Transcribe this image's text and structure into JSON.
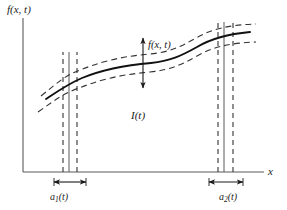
{
  "figure": {
    "type": "diagram",
    "axes": {
      "y_label": "f(x, t)",
      "x_label": "x",
      "origin_px": {
        "x": 23,
        "y": 172
      },
      "x_axis_end_px": 264,
      "y_axis_top_px": 18
    },
    "labels": {
      "y_axis": "f(x, t)",
      "x_axis": "x",
      "curve": "f(x, t)",
      "region": "I(t)",
      "strip_left_base": "a",
      "strip_left_sub": "1",
      "strip_left_arg": "(t)",
      "strip_right_base": "a",
      "strip_right_sub": "2",
      "strip_right_arg": "(t)"
    },
    "colors": {
      "ink": "#1a1a1a",
      "axis": "#555555",
      "dashed": "#3a3a3a",
      "background": "#ffffff"
    },
    "strips": {
      "left": {
        "solid_x_px": 69,
        "dashed_x_px": [
          63,
          77
        ],
        "measure_from_px": 63,
        "measure_to_px": 77,
        "measure_y_px": 182
      },
      "right": {
        "solid_x_px": 224,
        "dashed_x_px": [
          218,
          233
        ],
        "measure_from_px": 214,
        "measure_to_px": 238,
        "measure_y_px": 182
      }
    },
    "curve": {
      "style": "solid sigmoid rising left-to-right with central plateau",
      "envelope_style": "dashed, offset above and below the solid curve",
      "envelope_offset_px": 9,
      "points_px": [
        {
          "x": 47,
          "y": 97
        },
        {
          "x": 62,
          "y": 88
        },
        {
          "x": 78,
          "y": 79
        },
        {
          "x": 95,
          "y": 72
        },
        {
          "x": 112,
          "y": 67
        },
        {
          "x": 130,
          "y": 64
        },
        {
          "x": 150,
          "y": 63
        },
        {
          "x": 168,
          "y": 61
        },
        {
          "x": 186,
          "y": 54
        },
        {
          "x": 203,
          "y": 45
        },
        {
          "x": 219,
          "y": 38
        },
        {
          "x": 234,
          "y": 34
        },
        {
          "x": 249,
          "y": 32
        }
      ],
      "amplitude_arrow": {
        "x_px": 143,
        "top_y_px": 38,
        "bottom_y_px": 88,
        "double_headed": true
      }
    }
  }
}
